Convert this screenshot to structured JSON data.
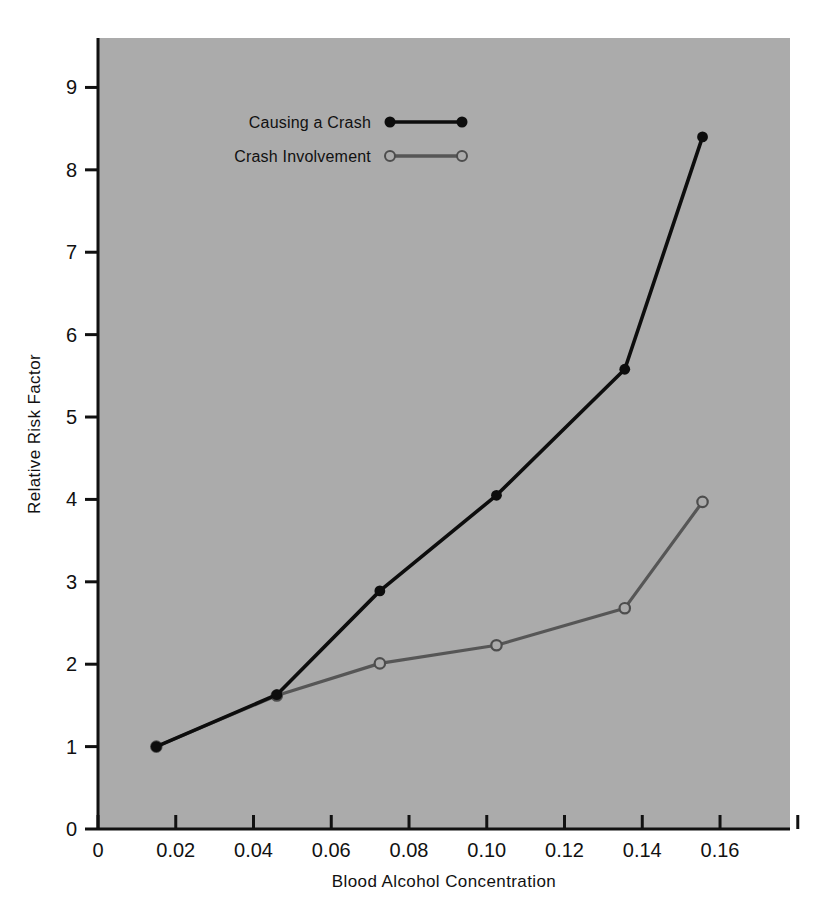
{
  "chart_data": {
    "type": "line",
    "title": "",
    "subtitle": "",
    "xlabel": "Blood Alcohol Concentration",
    "ylabel": "Relative Risk Factor",
    "xlim": [
      0,
      0.178
    ],
    "ylim": [
      0,
      9.6
    ],
    "grid": false,
    "legend_position": "top-left-inside",
    "background_color": "#ababab",
    "xticks": [
      0,
      0.02,
      0.04,
      0.06,
      0.08,
      0.1,
      0.12,
      0.14,
      0.16,
      0.18
    ],
    "xtick_labels": [
      "0",
      "0.02",
      "0.04",
      "0.06",
      "0.08",
      "0.10",
      "0.12",
      "0.14",
      "0.16",
      ""
    ],
    "yticks": [
      0,
      1,
      2,
      3,
      4,
      5,
      6,
      7,
      8,
      9
    ],
    "ytick_labels": [
      "0",
      "1",
      "2",
      "3",
      "4",
      "5",
      "6",
      "7",
      "8",
      "9"
    ],
    "series": [
      {
        "name": "Causing a Crash",
        "color": "#0d0d0d",
        "marker": "filled-circle",
        "x": [
          0.015,
          0.046,
          0.0725,
          0.1025,
          0.1355,
          0.1555
        ],
        "values": [
          1.0,
          1.63,
          2.89,
          4.05,
          5.58,
          8.4
        ]
      },
      {
        "name": "Crash Involvement",
        "color": "#565656",
        "marker": "open-circle",
        "x": [
          0.015,
          0.046,
          0.0725,
          0.1025,
          0.1355,
          0.1555
        ],
        "values": [
          1.0,
          1.62,
          2.01,
          2.23,
          2.68,
          3.97
        ]
      }
    ]
  },
  "legend": {
    "entries": [
      {
        "label": "Causing a Crash"
      },
      {
        "label": "Crash Involvement"
      }
    ]
  },
  "axes": {
    "x_title": "Blood Alcohol Concentration",
    "y_title": "Relative Risk Factor"
  }
}
